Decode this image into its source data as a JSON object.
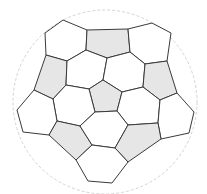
{
  "diagram": {
    "title": "",
    "colors": {
      "pentagon_fill": "#e6e6e6",
      "hexagon_fill": "#ffffff",
      "edge": "#3a3a3a",
      "outline": "#c8c8c8"
    },
    "outline_circle": {
      "cx": 105,
      "cy": 102,
      "r": 92
    },
    "faces": [
      {
        "type": "hexagon",
        "points": "63,20 87,30 86,50 67,61 46,55 45,33"
      },
      {
        "type": "pentagon",
        "points": "87,30 128,29 130,52 107,58 86,50"
      },
      {
        "type": "hexagon",
        "points": "128,29 152,23 171,33 167,61 145,64 130,52"
      },
      {
        "type": "pentagon",
        "points": "46,55 67,61 66,85 53,99 34,90"
      },
      {
        "type": "hexagon",
        "points": "67,61 86,50 107,58 103,80 89,89 66,85"
      },
      {
        "type": "hexagon",
        "points": "107,58 130,52 145,64 143,87 122,92 103,80"
      },
      {
        "type": "pentagon",
        "points": "145,64 167,61 177,93 160,100 143,87"
      },
      {
        "type": "pentagon",
        "points": "103,80 122,92 117,111 95,112 89,89"
      },
      {
        "type": "hexagon",
        "points": "66,85 89,89 95,112 80,126 57,121 53,99"
      },
      {
        "type": "hexagon",
        "points": "122,92 143,87 160,100 158,123 128,125 117,111"
      },
      {
        "type": "hexagon",
        "points": "34,90 53,99 57,121 49,135 23,132 17,110"
      },
      {
        "type": "hexagon",
        "points": "160,100 177,93 194,112 189,133 161,139 158,123"
      },
      {
        "type": "pentagon",
        "points": "49,135 57,121 80,126 92,145 76,160"
      },
      {
        "type": "hexagon",
        "points": "80,126 95,112 117,111 128,125 115,148 92,145"
      },
      {
        "type": "pentagon",
        "points": "128,125 158,123 161,139 128,162 115,148"
      },
      {
        "type": "hexagon",
        "points": "76,160 92,145 115,148 128,162 112,183 88,181"
      }
    ]
  }
}
